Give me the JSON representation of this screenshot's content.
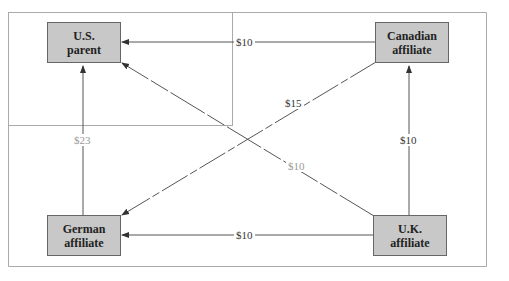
{
  "diagram": {
    "nodes": [
      {
        "id": "us",
        "line1": "U.S.",
        "line2": "parent"
      },
      {
        "id": "canada",
        "line1": "Canadian",
        "line2": "affiliate"
      },
      {
        "id": "germany",
        "line1": "German",
        "line2": "affiliate"
      },
      {
        "id": "uk",
        "line1": "U.K.",
        "line2": "affiliate"
      }
    ],
    "edges": [
      {
        "from": "canada",
        "to": "us",
        "label": "$10"
      },
      {
        "from": "germany",
        "to": "us",
        "label": "$23"
      },
      {
        "from": "uk",
        "to": "canada",
        "label": "$10"
      },
      {
        "from": "uk",
        "to": "germany",
        "label": "$10"
      },
      {
        "from": "canada",
        "to": "germany",
        "label": "$15"
      },
      {
        "from": "uk",
        "to": "us",
        "label": "$10"
      }
    ],
    "colors": {
      "box_fill": "#c8c8c8",
      "box_border": "#666666",
      "line": "#555555",
      "frame": "#aaaaaa"
    }
  }
}
